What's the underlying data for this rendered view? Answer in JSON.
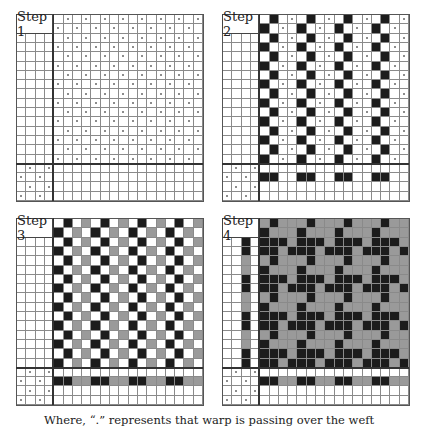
{
  "legend": {
    "dot": "warp over weft",
    "black": "#1c1c1c",
    "gray": "#9a9a9a",
    "white": "#ffffff"
  },
  "caption": "Where, “.” represents that warp is passing over the weft",
  "panels": [
    {
      "label": "Step 1",
      "x": 16,
      "y": 14,
      "cell": 9.35,
      "rows": [
        "WWWWW.W.W.W.W.W.W.W.",
        "WWWW.W.W.W.W.W.W.W.W",
        "WWWWW.W.W.W.W.W.W.W.",
        "WWWW.W.W.W.W.W.W.W.W",
        "WWWWW.W.W.W.W.W.W.W.",
        "WWWW.W.W.W.W.W.W.W.W",
        "WWWWW.W.W.W.W.W.W.W.",
        "WWWW.W.W.W.W.W.W.W.W",
        "WWWWW.W.W.W.W.W.W.W.",
        "WWWW.W.W.W.W.W.W.W.W",
        "WWWWW.W.W.W.W.W.W.W.",
        "WWWW.W.W.W.W.W.W.W.W",
        "WWWWW.W.W.W.W.W.W.W.",
        "WWWW.W.W.W.W.W.W.W.W",
        "WWWWW.W.W.W.W.W.W.W.",
        "WWWW.W.W.W.W.W.W.W.W",
        "W.W.WWWWWWWWWWWWWWWW",
        ".W.WWWWWWWWWWWWWWWWW",
        "W.W.WWWWWWWWWWWWWWWW",
        ".W.WWWWWWWWWWWWWWWWW"
      ]
    },
    {
      "label": "Step 2",
      "x": 222,
      "y": 14,
      "cell": 9.35,
      "rows": [
        "WWWWWBW.WBW.WBW.WBW.",
        "WWWWBW.WBW.WBW.WBW.W",
        "WWWWWBW.WBW.WBW.WBW.",
        "WWWWBW.WBW.WBW.WBW.W",
        "WWWWWBW.WBW.WBW.WBW.",
        "WWWWBW.WBW.WBW.WBW.W",
        "WWWWWBW.WBW.WBW.WBW.",
        "WWWWBW.WBW.WBW.WBW.W",
        "WWWWWBW.WBW.WBW.WBW.",
        "WWWWBW.WBW.WBW.WBW.W",
        "WWWWWBW.WBW.WBW.WBW.",
        "WWWWBW.WBW.WBW.WBW.W",
        "WWWWWBW.WBW.WBW.WBW.",
        "WWWWBW.WBW.WBW.WBW.W",
        "WWWWWBW.WBW.WBW.WBW.",
        "WWWWBW.WBW.WBW.WBW.W",
        "W.W.WWWWWWWWWWWWWWWW",
        ".W.WBBWWBBWWBBWWBBWW",
        "W.W.WWWWWWWWWWWWWWWW",
        ".W.WWWWWWWWWWWWWWWWW"
      ]
    },
    {
      "label": "Step 3",
      "x": 16,
      "y": 218,
      "cell": 9.35,
      "rows": [
        "WWWWWBWGWBWGWBWGWBWG",
        "WWWWBWGWBWGWBWGWBWGW",
        "WWWWWBWGWBWGWBWGWBWG",
        "WWWWBWGWBWGWBWGWBWGW",
        "WWWWWBWGWBWGWBWGWBWG",
        "WWWWBWGWBWGWBWGWBWGW",
        "WWWWWBWGWBWGWBWGWBWG",
        "WWWWBWGWBWGWBWGWBWGW",
        "WWWWWBWGWBWGWBWGWBWG",
        "WWWWBWGWBWGWBWGWBWGW",
        "WWWWWBWGWBWGWBWGWBWG",
        "WWWWBWGWBWGWBWGWBWGW",
        "WWWWWBWGWBWGWBWGWBWG",
        "WWWWBWGWBWGWBWGWBWGW",
        "WWWWWBWGWBWGWBWGWBWG",
        "WWWWBWGWBWGWBWGWBWGW",
        "W.W.WWWWWWWWWWWWWWWW",
        ".W.WBBGGBBGGBBGGBBGG",
        "W.W.WWWWWWWWWWWWWWWW",
        ".W.WWWWWWWWWWWWWWWWW"
      ]
    },
    {
      "label": "Step 4",
      "x": 222,
      "y": 218,
      "cell": 9.35,
      "rows": [
        "WWGWGBGGGBGGGBGGGBGG",
        "WWGWBGGGBGGGBGGGBGGG",
        "WWBWBBBGBBBGBBBGBBBG",
        "WWBWBBGBBBGBBBGBBBGB",
        "WWGWGBGGGBGGGBGGGBGG",
        "WWGWBGGGBGGGBGGGBGGG",
        "WWBWBBBGBBBGBBBGBBBG",
        "WWBWBBGBBBGBBBGBBBGB",
        "WWGWGBGGGBGGGBGGGBGG",
        "WWGWBGGGBGGGBGGGBGGG",
        "WWBWBBBGBBBGBBBGBBBG",
        "WWBWBBGBBBGBBBGBBBGB",
        "WWGWGBGGGBGGGBGGGBGG",
        "WWGWBGGGBGGGBGGGBGGG",
        "WWBWBBBGBBBGBBBGBBBG",
        "WWBWBBGBBBGBBBGBBBGB",
        "W.W.WWWWWWWWWWWWWWWW",
        ".W.WBBGGBBGGBBGGBBGG",
        "W.W.WWWWWWWWWWWWWWWW",
        ".W.WWWWWWWWWWWWWWWWW"
      ]
    }
  ]
}
